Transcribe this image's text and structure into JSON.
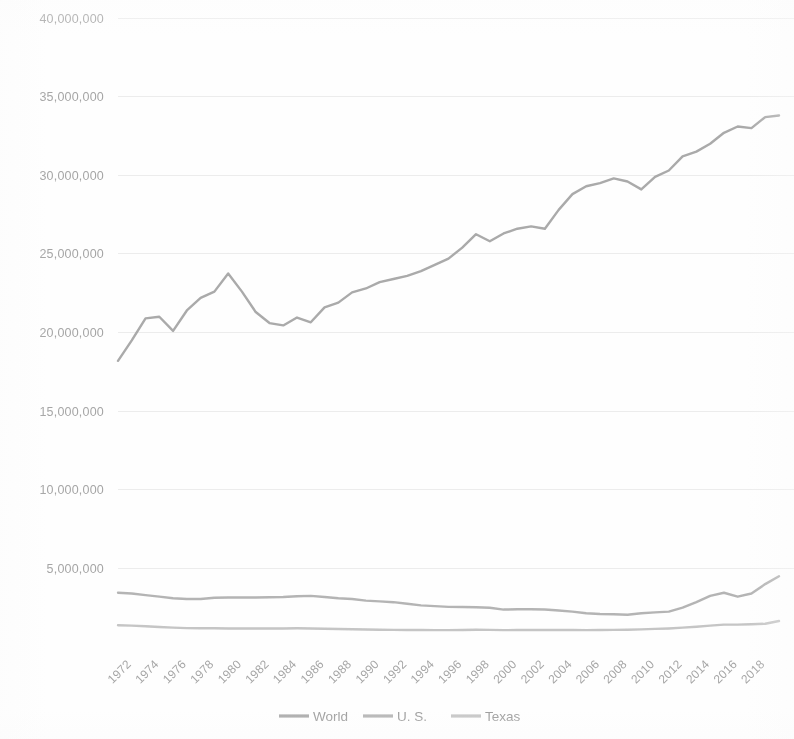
{
  "chart_data": {
    "type": "line",
    "title": "",
    "subtitle": "",
    "xlabel": "",
    "ylabel": "",
    "grid": true,
    "legend_position": "bottom",
    "xlim": [
      1971,
      2019
    ],
    "ylim": [
      0,
      40000000
    ],
    "ytick_labels": [
      "40,000,000",
      "35,000,000",
      "30,000,000",
      "25,000,000",
      "20,000,000",
      "15,000,000",
      "10,000,000",
      "5,000,000"
    ],
    "ytick_values": [
      40000000,
      35000000,
      30000000,
      25000000,
      20000000,
      15000000,
      10000000,
      5000000
    ],
    "xtick_labels": [
      "1972",
      "1974",
      "1976",
      "1978",
      "1980",
      "1982",
      "1984",
      "1986",
      "1988",
      "1990",
      "1992",
      "1994",
      "1996",
      "1998",
      "2000",
      "2002",
      "2004",
      "2006",
      "2008",
      "2010",
      "2012",
      "2014",
      "2016",
      "2018"
    ],
    "xtick_values": [
      1972,
      1974,
      1976,
      1978,
      1980,
      1982,
      1984,
      1986,
      1988,
      1990,
      1992,
      1994,
      1996,
      1998,
      2000,
      2002,
      2004,
      2006,
      2008,
      2010,
      2012,
      2014,
      2016,
      2018
    ],
    "x": [
      1971,
      1972,
      1973,
      1974,
      1975,
      1976,
      1977,
      1978,
      1979,
      1980,
      1981,
      1982,
      1983,
      1984,
      1985,
      1986,
      1987,
      1988,
      1989,
      1990,
      1991,
      1992,
      1993,
      1994,
      1995,
      1996,
      1997,
      1998,
      1999,
      2000,
      2001,
      2002,
      2003,
      2004,
      2005,
      2006,
      2007,
      2008,
      2009,
      2010,
      2011,
      2012,
      2013,
      2014,
      2015,
      2016,
      2017,
      2018,
      2019
    ],
    "series": [
      {
        "name": "World",
        "color": "#9a9a9a",
        "values": [
          18200000,
          19500000,
          20900000,
          21000000,
          20100000,
          21400000,
          22200000,
          22600000,
          23750000,
          22600000,
          21300000,
          20600000,
          20450000,
          20950000,
          20650000,
          21600000,
          21900000,
          22550000,
          22800000,
          23200000,
          23400000,
          23600000,
          23900000,
          24300000,
          24700000,
          25400000,
          26250000,
          25800000,
          26300000,
          26600000,
          26750000,
          26600000,
          27800000,
          28800000,
          29300000,
          29500000,
          29800000,
          29600000,
          29100000,
          29900000,
          30300000,
          31200000,
          31500000,
          32000000,
          32700000,
          33100000,
          33000000,
          33700000,
          33800000
        ]
      },
      {
        "name": "U. S.",
        "color": "#a8a8a8",
        "values": [
          3450000,
          3400000,
          3300000,
          3200000,
          3100000,
          3050000,
          3050000,
          3130000,
          3150000,
          3150000,
          3150000,
          3160000,
          3180000,
          3230000,
          3250000,
          3180000,
          3100000,
          3050000,
          2950000,
          2900000,
          2850000,
          2750000,
          2650000,
          2600000,
          2550000,
          2540000,
          2530000,
          2500000,
          2380000,
          2400000,
          2400000,
          2380000,
          2320000,
          2250000,
          2150000,
          2100000,
          2080000,
          2050000,
          2150000,
          2200000,
          2250000,
          2500000,
          2850000,
          3250000,
          3450000,
          3200000,
          3400000,
          4000000,
          4500000
        ]
      },
      {
        "name": "Texas",
        "color": "#bdbdbd",
        "values": [
          1380000,
          1360000,
          1320000,
          1270000,
          1230000,
          1200000,
          1190000,
          1190000,
          1180000,
          1180000,
          1180000,
          1180000,
          1180000,
          1190000,
          1180000,
          1160000,
          1140000,
          1130000,
          1110000,
          1100000,
          1090000,
          1080000,
          1080000,
          1070000,
          1070000,
          1080000,
          1100000,
          1090000,
          1070000,
          1080000,
          1090000,
          1080000,
          1080000,
          1080000,
          1070000,
          1080000,
          1090000,
          1100000,
          1120000,
          1150000,
          1180000,
          1230000,
          1290000,
          1360000,
          1420000,
          1420000,
          1450000,
          1480000,
          1650000
        ]
      }
    ]
  },
  "legend": {
    "items": [
      {
        "label": "World",
        "color": "#9a9a9a"
      },
      {
        "label": "U. S.",
        "color": "#a8a8a8"
      },
      {
        "label": "Texas",
        "color": "#bdbdbd"
      }
    ]
  },
  "axes": {
    "gridline_color": "#efefef",
    "tick_text_color": "#9b9b9b"
  }
}
